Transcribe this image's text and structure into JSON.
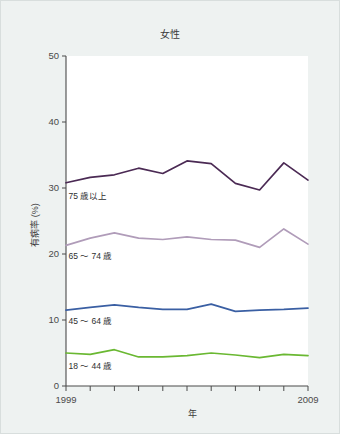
{
  "chart_data": {
    "type": "line",
    "title": "女性",
    "xlabel": "年",
    "ylabel": "有病率 (%)",
    "x": [
      1999,
      2000,
      2001,
      2002,
      2003,
      2004,
      2005,
      2006,
      2007,
      2008,
      2009
    ],
    "xtick_labels": [
      "1999",
      "2009"
    ],
    "xtick_label_first": "1999",
    "xtick_label_last": "2009",
    "xlim": [
      1999,
      2009
    ],
    "ylim": [
      0,
      50
    ],
    "ytick_labels": [
      "0",
      "10",
      "20",
      "30",
      "40",
      "50"
    ],
    "ytick_values": [
      0,
      10,
      20,
      30,
      40,
      50
    ],
    "grid": false,
    "legend_position": "inline-left-below-each-series",
    "series": [
      {
        "name": "75 歳以上",
        "color": "#4b2a54",
        "values": [
          30.8,
          31.6,
          32.0,
          33.0,
          32.2,
          34.1,
          33.7,
          30.7,
          29.7,
          33.8,
          31.2
        ],
        "label_x": 1999.1,
        "label_y": 28.4
      },
      {
        "name": "65 〜 74 歳",
        "color": "#b09cb9",
        "values": [
          21.3,
          22.4,
          23.2,
          22.4,
          22.2,
          22.6,
          22.2,
          22.1,
          21.0,
          23.8,
          21.5
        ],
        "label_x": 1999.1,
        "label_y": 19.2
      },
      {
        "name": "45 〜 64 歳",
        "color": "#3a5fa3",
        "values": [
          11.5,
          11.9,
          12.3,
          11.9,
          11.6,
          11.6,
          12.4,
          11.3,
          11.5,
          11.6,
          11.8
        ],
        "label_x": 1999.1,
        "label_y": 9.4
      },
      {
        "name": "18 〜 44 歳",
        "color": "#6ab832",
        "values": [
          5.0,
          4.8,
          5.5,
          4.4,
          4.4,
          4.6,
          5.0,
          4.7,
          4.3,
          4.8,
          4.6
        ],
        "label_x": 1999.1,
        "label_y": 2.6
      }
    ]
  }
}
